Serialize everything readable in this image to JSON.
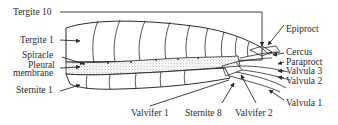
{
  "diagram": {
    "labels": {
      "tergite_10": "Tergite 10",
      "tergite_1": "Tergite 1",
      "spiracle": "Spiracle",
      "pleural_membrane_line1": "Pleural",
      "pleural_membrane_line2": "membrane",
      "sternite_1": "Sternite 1",
      "valvifer_1": "Valvifer 1",
      "sternite_8": "Sternite 8",
      "valvifer_2": "Valvifer 2",
      "epiproct": "Epiproct",
      "cercus": "Cercus",
      "paraproct": "Paraproct",
      "valvula_3": "Valvula 3",
      "valvula_2": "Valvula 2",
      "valvula_1": "Valvula 1"
    },
    "colors": {
      "line": "#2a2a2a",
      "background": "#ffffff",
      "stipple": "#555555"
    }
  }
}
